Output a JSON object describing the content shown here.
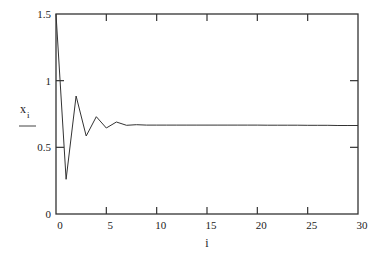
{
  "chart_data": {
    "type": "line",
    "title": "",
    "xlabel": "i",
    "ylabel": "x_i",
    "xlim": [
      0,
      30
    ],
    "ylim": [
      0,
      1.5
    ],
    "x_ticks": [
      0,
      5,
      10,
      15,
      20,
      25,
      30
    ],
    "x_tick_labels": [
      "0",
      "5",
      "10",
      "15",
      "20",
      "25",
      "30"
    ],
    "y_ticks": [
      0,
      0.5,
      1,
      1.5
    ],
    "y_tick_labels": [
      "0",
      "0.5",
      "1",
      "1.5"
    ],
    "grid": false,
    "legend": null,
    "series": [
      {
        "name": "x_i",
        "color": "#333333",
        "x": [
          0,
          1,
          2,
          3,
          4,
          5,
          6,
          7,
          8,
          9,
          10,
          11,
          12,
          13,
          14,
          15,
          16,
          17,
          18,
          19,
          20,
          21,
          22,
          23,
          24,
          25,
          26,
          27,
          28,
          29,
          30
        ],
        "values": [
          1.5,
          0.26,
          0.885,
          0.585,
          0.73,
          0.645,
          0.69,
          0.665,
          0.67,
          0.667,
          0.667,
          0.667,
          0.667,
          0.667,
          0.667,
          0.667,
          0.667,
          0.667,
          0.667,
          0.667,
          0.667,
          0.666,
          0.666,
          0.666,
          0.666,
          0.665,
          0.665,
          0.665,
          0.664,
          0.664,
          0.664
        ]
      }
    ]
  },
  "labels": {
    "x_axis": "i",
    "y_axis_main": "x",
    "y_axis_sub": "i"
  },
  "colors": {
    "frame": "#333333",
    "line": "#333333",
    "background": "#ffffff"
  }
}
